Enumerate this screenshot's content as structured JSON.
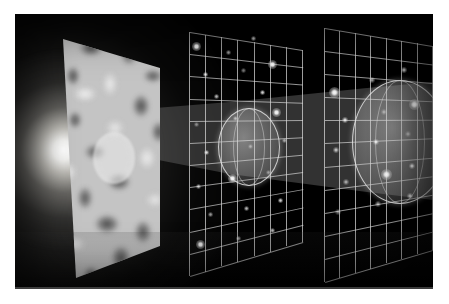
{
  "figure": {
    "alt_text": "Black space scene with a bright glow at left, a grayscale cosmic microwave background map plane, a widening translucent light beam, and two white wireframe grid planes holding translucent spherical survey volumes speckled with galaxies.",
    "border_color": "#ffffff",
    "background_color": "#000000"
  },
  "scene": {
    "light_source": {
      "name": "big-bang-glow",
      "label": "Big Bang glow",
      "color": "#ffffff",
      "center_x": 58,
      "center_y": 146
    },
    "cmb_plane": {
      "name": "cmb-map-plane",
      "label": "Cosmic microwave background map",
      "base_color": "#c4c4c4",
      "hot_spot_color": "#efefef",
      "cold_spot_color": "#4a4a4a",
      "disc_label": "observed patch"
    },
    "beam": {
      "name": "light-cone-beam",
      "label": "Light cone",
      "color": "#bebebe",
      "opacity": 0.28
    },
    "grid_planes": [
      {
        "name": "grid-plane-near",
        "label": "Galaxy survey slice 1",
        "line_color": "#dcdcdc",
        "columns": 7,
        "rows": 11,
        "volume_label": "survey volume 1"
      },
      {
        "name": "grid-plane-far",
        "label": "Galaxy survey slice 2",
        "line_color": "#dcdcdc",
        "columns": 7,
        "rows": 11,
        "volume_label": "survey volume 2"
      }
    ],
    "galaxies": {
      "name": "galaxy-points",
      "label": "Galaxies",
      "color": "#ffffff",
      "count": 38
    }
  },
  "chart_data": {
    "type": "scatter",
    "xlabel": "",
    "ylabel": "",
    "legend": [],
    "grid": true,
    "series": [
      {
        "name": "grid-plane-near-galaxies",
        "values": [
          [
            196,
            46
          ],
          [
            228,
            52
          ],
          [
            253,
            38
          ],
          [
            205,
            74
          ],
          [
            243,
            70
          ],
          [
            272,
            64
          ],
          [
            216,
            96
          ],
          [
            262,
            92
          ],
          [
            196,
            124
          ],
          [
            235,
            118
          ],
          [
            276,
            112
          ],
          [
            206,
            152
          ],
          [
            250,
            146
          ],
          [
            284,
            140
          ],
          [
            198,
            186
          ],
          [
            232,
            178
          ],
          [
            268,
            172
          ],
          [
            210,
            214
          ],
          [
            246,
            208
          ],
          [
            280,
            200
          ],
          [
            200,
            244
          ],
          [
            238,
            238
          ],
          [
            272,
            230
          ]
        ]
      },
      {
        "name": "grid-plane-far-galaxies",
        "values": [
          [
            334,
            92
          ],
          [
            372,
            80
          ],
          [
            404,
            70
          ],
          [
            345,
            120
          ],
          [
            384,
            112
          ],
          [
            414,
            104
          ],
          [
            336,
            150
          ],
          [
            376,
            142
          ],
          [
            408,
            134
          ],
          [
            346,
            182
          ],
          [
            386,
            174
          ],
          [
            412,
            166
          ],
          [
            338,
            212
          ],
          [
            378,
            204
          ],
          [
            410,
            196
          ]
        ]
      }
    ]
  }
}
